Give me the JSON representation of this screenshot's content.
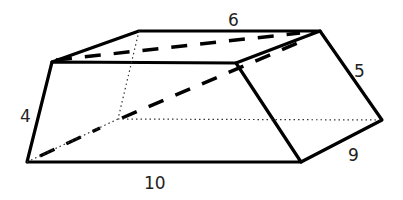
{
  "figure": {
    "type": "prismatoid-solid",
    "labels": {
      "top_edge": "6",
      "right_slant_edge": "5",
      "left_edge": "4",
      "bottom_right_edge": "9",
      "bottom_edge": "10"
    },
    "colors": {
      "stroke": "#000000",
      "background": "#ffffff",
      "label": "#222222"
    }
  }
}
